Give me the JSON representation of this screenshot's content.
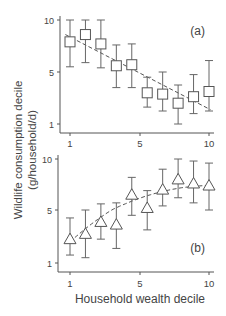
{
  "figure": {
    "ylabel_line1": "Wildlife consumption decile",
    "ylabel_line2": "(g/household/d)",
    "xlabel": "Household wealth decile"
  },
  "chart_data": [
    {
      "type": "scatter",
      "panel_label": "(a)",
      "marker": "square",
      "x": [
        1,
        2,
        3,
        4,
        5,
        6,
        7,
        8,
        9,
        10
      ],
      "values": [
        7.9,
        8.6,
        7.7,
        5.6,
        5.7,
        3.4,
        3.3,
        2.6,
        3.1,
        3.5
      ],
      "error_upper": [
        10.0,
        10.0,
        10.0,
        7.6,
        7.7,
        4.6,
        5.0,
        4.0,
        4.8,
        6.1
      ],
      "error_lower": [
        5.5,
        5.9,
        5.4,
        3.8,
        3.8,
        2.3,
        2.0,
        1.0,
        1.8,
        2.0
      ],
      "fit": {
        "style": "dashed",
        "shape": "linear-decreasing",
        "x": [
          0.7,
          10.1
        ],
        "y": [
          8.6,
          2.1
        ]
      },
      "xlabel": "Household wealth decile",
      "ylabel": "Wildlife consumption decile (g/household/d)",
      "xticks": [
        1,
        5,
        10
      ],
      "yticks": [
        1,
        5,
        10
      ],
      "xlim": [
        0.5,
        10.3
      ],
      "ylim": [
        0.5,
        10.3
      ],
      "grid": false
    },
    {
      "type": "scatter",
      "panel_label": "(b)",
      "marker": "triangle",
      "x": [
        1,
        2,
        3,
        4,
        5,
        6,
        7,
        8,
        9,
        10
      ],
      "values": [
        2.8,
        3.2,
        4.1,
        3.9,
        6.5,
        5.2,
        7.0,
        8.0,
        7.6,
        7.4
      ],
      "error_upper": [
        4.4,
        5.0,
        5.6,
        5.7,
        8.2,
        6.9,
        9.0,
        10.0,
        9.8,
        9.6
      ],
      "error_lower": [
        1.6,
        1.4,
        2.8,
        2.1,
        4.6,
        3.5,
        5.4,
        6.2,
        5.7,
        5.0
      ],
      "fit": {
        "style": "dashed",
        "shape": "quadratic-saturating"
      },
      "xlabel": "Household wealth decile",
      "ylabel": "Wildlife consumption decile (g/household/d)",
      "xticks": [
        1,
        5,
        10
      ],
      "yticks": [
        1,
        5,
        10
      ],
      "xlim": [
        0.5,
        10.3
      ],
      "ylim": [
        0.5,
        10.3
      ],
      "grid": false
    }
  ],
  "panels": [
    {
      "label": "(a)",
      "ytick_labels": [
        "10",
        "5",
        "1"
      ],
      "xtick_labels": [
        "1",
        "5",
        "10"
      ]
    },
    {
      "label": "(b)",
      "ytick_labels": [
        "10",
        "5",
        "1"
      ],
      "xtick_labels": [
        "1",
        "5",
        "10"
      ]
    }
  ],
  "colors": {
    "axis": "#555555",
    "marker": "#555555",
    "errorbar": "#666666",
    "fit": "#555555",
    "text": "#444444"
  }
}
